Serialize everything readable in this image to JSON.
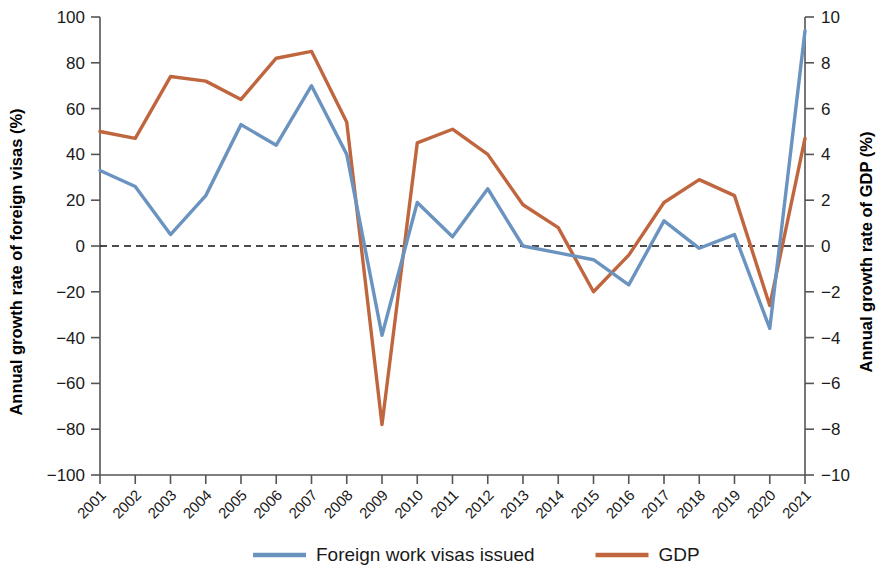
{
  "chart_data": {
    "type": "line",
    "title": "",
    "xlabel": "",
    "ylabel": "Annual growth rate of foreign visas (%)",
    "y2label": "Annual growth rate of GDP (%)",
    "ylim": [
      -100,
      100
    ],
    "y2lim": [
      -10,
      10
    ],
    "grid": false,
    "legend_position": "bottom",
    "zero_reference_line": true,
    "categories": [
      "2001",
      "2002",
      "2003",
      "2004",
      "2005",
      "2006",
      "2007",
      "2008",
      "2009",
      "2010",
      "2011",
      "2012",
      "2013",
      "2014",
      "2015",
      "2016",
      "2017",
      "2018",
      "2019",
      "2020",
      "2021"
    ],
    "x": [
      2001,
      2002,
      2003,
      2004,
      2005,
      2006,
      2007,
      2008,
      2009,
      2010,
      2011,
      2012,
      2013,
      2014,
      2015,
      2016,
      2017,
      2018,
      2019,
      2020,
      2021
    ],
    "ytick_labels": [
      "100",
      "80",
      "60",
      "40",
      "20",
      "0",
      "-20",
      "-40",
      "-60",
      "-80",
      "-100"
    ],
    "ytick_values": [
      100,
      80,
      60,
      40,
      20,
      0,
      -20,
      -40,
      -60,
      -80,
      -100
    ],
    "y2tick_labels": [
      "10",
      "8",
      "6",
      "4",
      "2",
      "0",
      "-2",
      "-4",
      "-6",
      "-8",
      "-10"
    ],
    "y2tick_values": [
      10,
      8,
      6,
      4,
      2,
      0,
      -2,
      -4,
      -6,
      -8,
      -10
    ],
    "series": [
      {
        "name": "Foreign work visas issued",
        "axis": "left",
        "color": "#6A93C0",
        "values": [
          33,
          26,
          5,
          22,
          53,
          44,
          70,
          40,
          -39,
          19,
          4,
          25,
          0,
          -3,
          -6,
          -17,
          11,
          -1,
          5,
          -36,
          94
        ]
      },
      {
        "name": "GDP",
        "axis": "right",
        "color": "#C0663F",
        "values": [
          5.0,
          4.7,
          7.4,
          7.2,
          6.4,
          8.2,
          8.5,
          5.4,
          -7.8,
          4.5,
          5.1,
          4.0,
          1.8,
          0.8,
          -2.0,
          -0.4,
          1.9,
          2.9,
          2.2,
          -2.6,
          4.7
        ]
      }
    ]
  },
  "legend": {
    "items": [
      {
        "label": "Foreign work visas issued",
        "color": "#6A93C0"
      },
      {
        "label": "GDP",
        "color": "#C0663F"
      }
    ]
  }
}
